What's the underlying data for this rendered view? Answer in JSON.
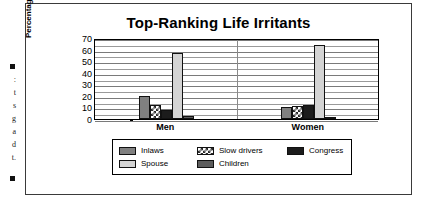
{
  "page": {
    "bleed_text": [
      ":",
      "t",
      "s",
      "g",
      "a",
      "d",
      "t."
    ]
  },
  "chart_data": {
    "type": "bar",
    "title": "Top-Ranking Life Irritants",
    "xlabel": "",
    "ylabel": "Percentage Ranking #1",
    "categories": [
      "Men",
      "Women"
    ],
    "ylim": [
      0,
      70
    ],
    "ytick_step": 10,
    "yticks": [
      "70",
      "60",
      "50",
      "40",
      "30",
      "20",
      "10",
      "0"
    ],
    "grid": true,
    "grid_minor": true,
    "legend_position": "bottom",
    "series": [
      {
        "name": "Inlaws",
        "values": [
          20,
          10
        ],
        "color": "#808080",
        "pattern": "solid"
      },
      {
        "name": "Slow drivers",
        "values": [
          12,
          11
        ],
        "color": "#ffffff",
        "pattern": "checker"
      },
      {
        "name": "Congress",
        "values": [
          8,
          12
        ],
        "color": "#1c1c1c",
        "pattern": "solid"
      },
      {
        "name": "Spouse",
        "values": [
          57,
          64
        ],
        "color": "#d4d4d4",
        "pattern": "solid"
      },
      {
        "name": "Children",
        "values": [
          3,
          2
        ],
        "color": "#5c5c5c",
        "pattern": "solid"
      }
    ]
  }
}
